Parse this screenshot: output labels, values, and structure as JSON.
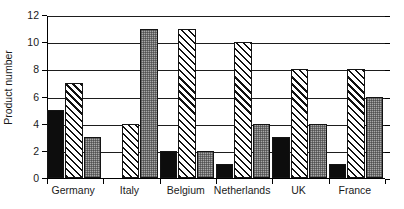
{
  "chart_data": {
    "type": "bar",
    "title": "",
    "subtitle": "",
    "xlabel": "",
    "ylabel": "Product number",
    "categories": [
      "Germany",
      "Italy",
      "Belgium",
      "Netherlands",
      "UK",
      "France"
    ],
    "series": [
      {
        "name": "series-1",
        "pattern": "solid-black",
        "color": "#0d0d0d",
        "values": [
          5,
          0,
          2,
          1,
          3,
          1
        ]
      },
      {
        "name": "series-2",
        "pattern": "diagonal-hatch",
        "color": "#ffffff",
        "values": [
          7,
          4,
          11,
          10,
          8,
          8
        ]
      },
      {
        "name": "series-3",
        "pattern": "gray-checker",
        "color": "#a8a8a8",
        "values": [
          3,
          11,
          2,
          4,
          4,
          6
        ]
      }
    ],
    "ylim": [
      0,
      12
    ],
    "yticks": [
      0,
      2,
      4,
      6,
      8,
      10,
      12
    ],
    "ytick_labels": [
      "0",
      "2",
      "4",
      "6",
      "8",
      "10",
      "12"
    ],
    "grid": true,
    "grid_axis": "y",
    "legend": false,
    "legend_position": "none"
  }
}
